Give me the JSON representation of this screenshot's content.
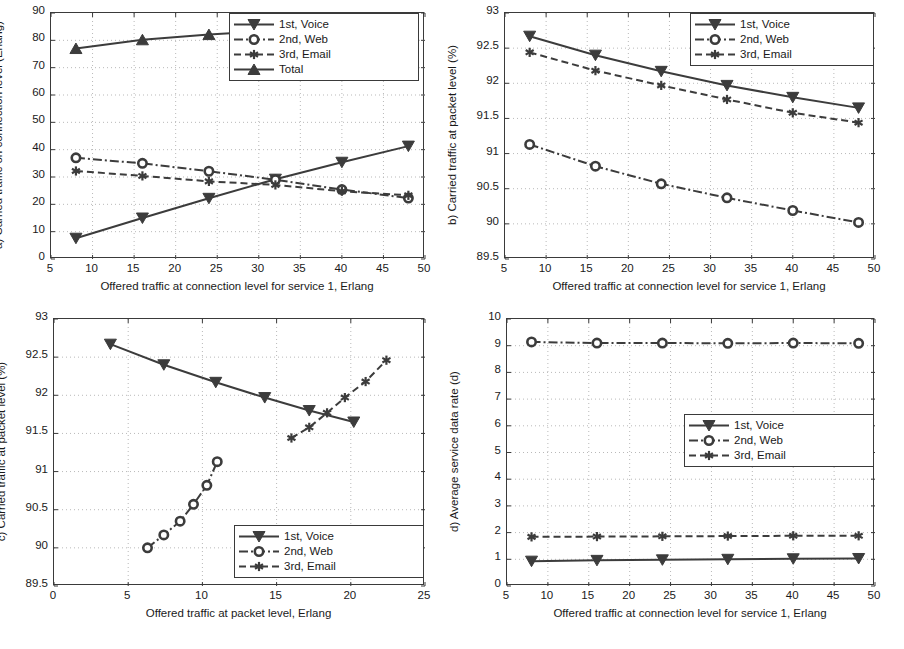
{
  "figure": {
    "width": 904,
    "height": 649,
    "background": "#ffffff",
    "axis_color": "#3a3a3a",
    "grid_color": "#b9b9b9",
    "series_color": "#3c3c3c"
  },
  "chart_data": [
    {
      "id": "panel-a",
      "type": "line",
      "title": "",
      "ylabel": "a) Carried traffic on connection level (Erlang)",
      "xlabel": "Offered traffic at connection level for service 1, Erlang",
      "xlim": [
        5,
        50
      ],
      "ylim": [
        0,
        90
      ],
      "xticks": [
        5,
        10,
        15,
        20,
        25,
        30,
        35,
        40,
        45,
        50
      ],
      "yticks": [
        0,
        10,
        20,
        30,
        40,
        50,
        60,
        70,
        80,
        90
      ],
      "grid": true,
      "legend_position": "top-right",
      "x": [
        8,
        16,
        24,
        32,
        40,
        48
      ],
      "series": [
        {
          "name": "1st, Voice",
          "marker": "triangle-down",
          "line": "solid",
          "values": [
            7.6,
            15.0,
            22.2,
            29.2,
            35.4,
            41.3
          ]
        },
        {
          "name": "2nd, Web",
          "marker": "circle",
          "line": "dashdot",
          "values": [
            37.0,
            35.0,
            32.1,
            29.0,
            25.4,
            22.3
          ]
        },
        {
          "name": "3rd, Email",
          "marker": "asterisk",
          "line": "dashed",
          "values": [
            32.2,
            30.4,
            28.4,
            27.1,
            24.8,
            23.3
          ]
        },
        {
          "name": "Total",
          "marker": "triangle-up",
          "line": "solid",
          "values": [
            77.0,
            80.2,
            82.1,
            83.6,
            84.3,
            84.6
          ]
        }
      ]
    },
    {
      "id": "panel-b",
      "type": "line",
      "title": "",
      "ylabel": "b) Carried traffic at packet level (%)",
      "xlabel": "Offered traffic at connection level for service 1, Erlang",
      "xlim": [
        5,
        50
      ],
      "ylim": [
        89.5,
        93
      ],
      "xticks": [
        5,
        10,
        15,
        20,
        25,
        30,
        35,
        40,
        45,
        50
      ],
      "yticks": [
        89.5,
        90,
        90.5,
        91,
        91.5,
        92,
        92.5,
        93
      ],
      "ytick_labels": [
        "89.5",
        "90",
        "90.5",
        "91",
        "91.5",
        "92",
        "92.5",
        "93"
      ],
      "grid": true,
      "legend_position": "top-right",
      "x": [
        8,
        16,
        24,
        32,
        40,
        48
      ],
      "series": [
        {
          "name": "1st, Voice",
          "marker": "triangle-down",
          "line": "solid",
          "values": [
            92.67,
            92.4,
            92.17,
            91.97,
            91.8,
            91.65
          ]
        },
        {
          "name": "2nd, Web",
          "marker": "circle",
          "line": "dashdot",
          "values": [
            91.13,
            90.82,
            90.57,
            90.37,
            90.19,
            90.02
          ]
        },
        {
          "name": "3rd, Email",
          "marker": "asterisk",
          "line": "dashed",
          "values": [
            92.44,
            92.18,
            91.97,
            91.77,
            91.58,
            91.44
          ]
        }
      ]
    },
    {
      "id": "panel-c",
      "type": "line",
      "ylabel": "c) Carried traffic at packet level (%)",
      "xlabel": "Offered traffic at packet level, Erlang",
      "xlim": [
        0,
        25
      ],
      "ylim": [
        89.5,
        93
      ],
      "xticks": [
        0,
        5,
        10,
        15,
        20,
        25
      ],
      "yticks": [
        89.5,
        90,
        90.5,
        91,
        91.5,
        92,
        92.5,
        93
      ],
      "ytick_labels": [
        "89.5",
        "90",
        "90.5",
        "91",
        "91.5",
        "92",
        "92.5",
        "93"
      ],
      "grid": true,
      "legend_position": "bottom-right",
      "series": [
        {
          "name": "1st, Voice",
          "marker": "triangle-down",
          "line": "solid",
          "x": [
            3.8,
            7.4,
            10.9,
            14.2,
            17.2,
            20.2
          ],
          "values": [
            92.67,
            92.4,
            92.17,
            91.97,
            91.8,
            91.65
          ]
        },
        {
          "name": "2nd, Web",
          "marker": "circle",
          "line": "dashdot",
          "x": [
            6.3,
            7.4,
            8.5,
            9.4,
            10.3,
            11.0
          ],
          "values": [
            90.0,
            90.17,
            90.35,
            90.57,
            90.82,
            91.13
          ]
        },
        {
          "name": "3rd, Email",
          "marker": "asterisk",
          "line": "dashed",
          "x": [
            16.0,
            17.2,
            18.4,
            19.6,
            21.0,
            22.4
          ],
          "values": [
            91.44,
            91.58,
            91.77,
            91.97,
            92.18,
            92.46
          ]
        }
      ]
    },
    {
      "id": "panel-d",
      "type": "line",
      "ylabel": "d) Average service data rate (d)",
      "xlabel": "Offered traffic at connection level for service 1, Erlang",
      "xlim": [
        5,
        50
      ],
      "ylim": [
        0,
        10
      ],
      "xticks": [
        5,
        10,
        15,
        20,
        25,
        30,
        35,
        40,
        45,
        50
      ],
      "yticks": [
        0,
        1,
        2,
        3,
        4,
        5,
        6,
        7,
        8,
        9,
        10
      ],
      "grid": true,
      "legend_position": "middle-right",
      "x": [
        8,
        16,
        24,
        32,
        40,
        48
      ],
      "series": [
        {
          "name": "1st, Voice",
          "marker": "triangle-down",
          "line": "solid",
          "values": [
            0.93,
            0.96,
            0.98,
            1.0,
            1.02,
            1.03
          ]
        },
        {
          "name": "2nd, Web",
          "marker": "circle",
          "line": "dashdot",
          "values": [
            9.14,
            9.1,
            9.1,
            9.09,
            9.1,
            9.09
          ]
        },
        {
          "name": "3rd, Email",
          "marker": "asterisk",
          "line": "dashed",
          "values": [
            1.84,
            1.85,
            1.86,
            1.87,
            1.88,
            1.88
          ]
        }
      ]
    }
  ]
}
